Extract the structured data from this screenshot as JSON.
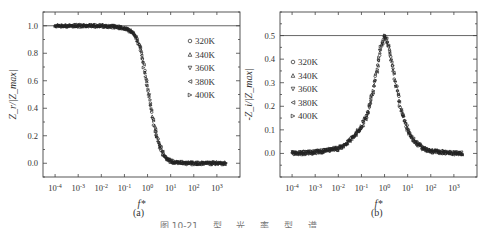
{
  "figure": {
    "caption_partial": "图 10-21 … 型 … 光 … 率 … 型 … 谱",
    "panels": [
      {
        "label": "(a)"
      },
      {
        "label": "(b)"
      }
    ]
  },
  "chart_data": [
    {
      "type": "scatter",
      "panel": "(a)",
      "title": "",
      "xlabel": "f*",
      "ylabel": "Z_r/|Z_max|",
      "xscale": "log",
      "xlim": [
        3e-05,
        10000
      ],
      "ylim": [
        -0.1,
        1.1
      ],
      "x_ticks": [
        "10^-4",
        "10^-3",
        "10^-2",
        "10^-1",
        "10^0",
        "10^1",
        "10^2",
        "10^3"
      ],
      "y_ticks": [
        "0.0",
        "0.2",
        "0.4",
        "0.6",
        "0.8",
        "1.0"
      ],
      "reference_line": {
        "y": 1.0
      },
      "legend_position": "upper right",
      "grid": false,
      "series": [
        {
          "name": "320K",
          "marker": "circle"
        },
        {
          "name": "340K",
          "marker": "triangle-up"
        },
        {
          "name": "360K",
          "marker": "triangle-down"
        },
        {
          "name": "380K",
          "marker": "triangle-left"
        },
        {
          "name": "400K",
          "marker": "triangle-right"
        }
      ],
      "x": [
        0.0001,
        0.001,
        0.01,
        0.05,
        0.1,
        0.2,
        0.3,
        0.5,
        0.7,
        1,
        1.5,
        2,
        3,
        5,
        7,
        10,
        20,
        50,
        100,
        1000,
        2500
      ],
      "values": [
        1.0,
        1.0,
        1.0,
        0.99,
        0.98,
        0.96,
        0.93,
        0.83,
        0.7,
        0.55,
        0.38,
        0.26,
        0.15,
        0.06,
        0.03,
        0.015,
        0.005,
        0.0,
        0.0,
        0.0,
        0.0
      ],
      "annotations": [
        "outlier scatter near f*=0.05-0.08 at ~0.92-0.95"
      ]
    },
    {
      "type": "scatter",
      "panel": "(b)",
      "title": "",
      "xlabel": "f*",
      "ylabel": "-Z_i/|Z_max|",
      "xscale": "log",
      "xlim": [
        3e-05,
        10000
      ],
      "ylim": [
        -0.1,
        0.6
      ],
      "x_ticks": [
        "10^-4",
        "10^-3",
        "10^-2",
        "10^-1",
        "10^0",
        "10^1",
        "10^2",
        "10^3"
      ],
      "y_ticks": [
        "0.0",
        "0.1",
        "0.2",
        "0.3",
        "0.4",
        "0.5"
      ],
      "reference_line": {
        "y": 0.5
      },
      "legend_position": "upper left",
      "grid": false,
      "series": [
        {
          "name": "320K",
          "marker": "circle"
        },
        {
          "name": "340K",
          "marker": "triangle-up"
        },
        {
          "name": "360K",
          "marker": "triangle-down"
        },
        {
          "name": "380K",
          "marker": "triangle-left"
        },
        {
          "name": "400K",
          "marker": "triangle-right"
        }
      ],
      "x": [
        0.0001,
        0.001,
        0.01,
        0.03,
        0.1,
        0.2,
        0.3,
        0.5,
        0.7,
        1,
        1.5,
        2,
        3,
        5,
        10,
        20,
        50,
        100,
        1000,
        2500
      ],
      "values": [
        0.0,
        0.005,
        0.02,
        0.05,
        0.11,
        0.18,
        0.25,
        0.37,
        0.45,
        0.5,
        0.46,
        0.4,
        0.3,
        0.19,
        0.1,
        0.05,
        0.02,
        0.01,
        0.0,
        0.0
      ]
    }
  ]
}
